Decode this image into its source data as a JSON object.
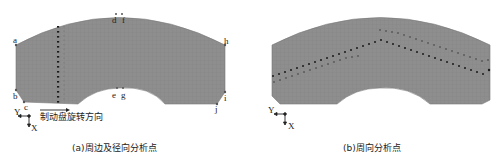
{
  "figure": {
    "panel_a": {
      "caption": "(a)周边及径向分析点",
      "direction_label": "制动盘旋转方向",
      "point_labels": {
        "a": "a",
        "b_left": "b",
        "c": "c",
        "d": "d",
        "f": "f",
        "e": "e",
        "g": "g",
        "h": "h",
        "i": "i",
        "j": "j"
      },
      "axes": {
        "y": "Y",
        "x": "X"
      }
    },
    "panel_b": {
      "caption": "(b)周向分析点",
      "axes": {
        "y": "Y",
        "x": "X"
      }
    },
    "colors": {
      "mesh_fill": "#8e8e8e",
      "mesh_line": "#7d7d7d",
      "points": "#1a1a1a",
      "text": "#222222"
    }
  }
}
